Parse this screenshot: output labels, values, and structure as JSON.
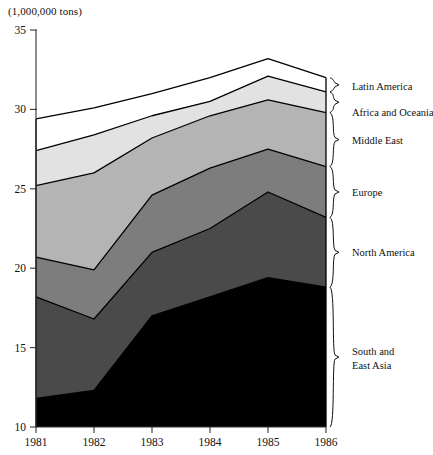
{
  "axis_unit_label": "(1,000,000 tons)",
  "y_ticks": [
    "10",
    "15",
    "20",
    "25",
    "30",
    "35"
  ],
  "x_ticks": [
    "1981",
    "1982",
    "1983",
    "1984",
    "1985",
    "1986"
  ],
  "legend": [
    {
      "label": "Latin America"
    },
    {
      "label": "Africa and Oceania"
    },
    {
      "label": "Middle East"
    },
    {
      "label": "Europe"
    },
    {
      "label": "North America"
    },
    {
      "label_line1": "South and",
      "label_line2": "East Asia"
    }
  ],
  "colors": {
    "south_east_asia": "#000000",
    "north_america": "#4a4a4a",
    "europe": "#7d7d7d",
    "middle_east": "#b4b4b4",
    "africa_oceania": "#e2e2e2",
    "latin_america": "#ffffff",
    "axis": "#333333",
    "outline": "#000000"
  },
  "chart_data": {
    "type": "area",
    "stacked": true,
    "title": "",
    "subtitle": "",
    "xlabel": "",
    "ylabel": "(1,000,000 tons)",
    "x": [
      1981,
      1982,
      1983,
      1984,
      1985,
      1986
    ],
    "xlim": [
      1981,
      1986
    ],
    "ylim": [
      10,
      35
    ],
    "ybaseline": 10,
    "grid": false,
    "legend_position": "right",
    "series": [
      {
        "name": "South and East Asia",
        "values": [
          11.8,
          12.3,
          17.0,
          18.2,
          19.4,
          18.8
        ]
      },
      {
        "name": "North America",
        "values": [
          6.4,
          4.5,
          4.0,
          4.3,
          5.4,
          4.4
        ]
      },
      {
        "name": "Europe",
        "values": [
          2.5,
          3.1,
          3.6,
          3.8,
          2.7,
          3.2
        ]
      },
      {
        "name": "Middle East",
        "values": [
          4.5,
          6.1,
          3.6,
          3.3,
          3.1,
          3.4
        ]
      },
      {
        "name": "Africa and Oceania",
        "values": [
          2.2,
          2.4,
          1.4,
          0.9,
          1.5,
          1.3
        ]
      },
      {
        "name": "Latin America",
        "values": [
          2.0,
          1.7,
          1.4,
          1.5,
          1.1,
          0.9
        ]
      }
    ],
    "cumulative_tops": {
      "south_east_asia": [
        11.8,
        12.3,
        17.0,
        18.2,
        19.4,
        18.8
      ],
      "north_america": [
        18.2,
        16.8,
        21.0,
        22.5,
        24.8,
        23.2
      ],
      "europe": [
        20.7,
        19.9,
        24.6,
        26.3,
        27.5,
        26.4
      ],
      "middle_east": [
        25.2,
        26.0,
        28.2,
        29.6,
        30.6,
        29.8
      ],
      "africa_oceania": [
        27.4,
        28.4,
        29.6,
        30.5,
        32.1,
        31.1
      ],
      "latin_america": [
        29.4,
        30.1,
        31.0,
        32.0,
        33.2,
        32.0
      ]
    }
  }
}
